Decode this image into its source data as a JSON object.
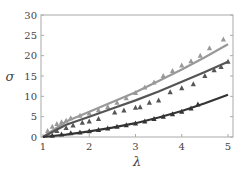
{
  "chart_data": {
    "type": "line",
    "title": "",
    "xlabel": "λ",
    "ylabel": "σ",
    "xlim": [
      1,
      5.1
    ],
    "ylim": [
      0,
      30
    ],
    "xticks": [
      1,
      2,
      3,
      4,
      5
    ],
    "yticks": [
      0,
      5,
      10,
      15,
      20,
      25,
      30
    ],
    "grid": false,
    "legend": null,
    "series": [
      {
        "name": "upper",
        "color": "#999999",
        "kind": "fit-line",
        "x": [
          1,
          1.5,
          2,
          2.5,
          3,
          3.5,
          4,
          4.5,
          5
        ],
        "y": [
          0,
          3.8,
          6.2,
          8.6,
          11.0,
          13.8,
          16.6,
          19.6,
          22.8
        ]
      },
      {
        "name": "upper-data",
        "color": "#999999",
        "kind": "triangles",
        "x": [
          1.1,
          1.2,
          1.3,
          1.4,
          1.5,
          1.6,
          1.8,
          2.0,
          2.2,
          2.4,
          2.6,
          2.8,
          3.0,
          3.2,
          3.4,
          3.6,
          3.8,
          4.0,
          4.2,
          4.4,
          4.6,
          4.9
        ],
        "y": [
          1.5,
          2.5,
          3.2,
          3.6,
          4.0,
          4.6,
          5.2,
          5.8,
          6.6,
          7.4,
          8.4,
          9.5,
          10.8,
          12.2,
          13.4,
          15.0,
          16.2,
          17.6,
          18.6,
          20.0,
          21.8,
          24.0
        ]
      },
      {
        "name": "middle",
        "color": "#555555",
        "kind": "fit-line",
        "x": [
          1,
          1.5,
          2,
          2.5,
          3,
          3.5,
          4,
          4.5,
          5
        ],
        "y": [
          0,
          3.0,
          5.0,
          7.0,
          9.0,
          11.2,
          13.6,
          16.0,
          18.5
        ]
      },
      {
        "name": "middle-data",
        "color": "#555555",
        "kind": "triangles",
        "x": [
          1.3,
          1.5,
          1.65,
          1.85,
          2.0,
          2.2,
          2.55,
          2.75,
          3.0,
          3.1,
          3.3,
          3.5,
          3.75,
          4.0,
          4.25,
          4.5,
          4.7,
          4.85,
          5.0
        ],
        "y": [
          1.5,
          2.2,
          2.8,
          3.5,
          3.8,
          4.4,
          6.0,
          6.5,
          7.2,
          7.3,
          8.4,
          9.0,
          11.0,
          12.0,
          13.0,
          15.0,
          16.4,
          17.2,
          18.5
        ]
      },
      {
        "name": "lower",
        "color": "#333333",
        "kind": "fit-line",
        "x": [
          1,
          1.5,
          2,
          2.5,
          3,
          3.5,
          4,
          4.5,
          5
        ],
        "y": [
          0,
          0.6,
          1.4,
          2.3,
          3.4,
          4.8,
          6.4,
          8.3,
          10.4
        ]
      },
      {
        "name": "lower-data",
        "color": "#333333",
        "kind": "triangles",
        "x": [
          1.2,
          1.4,
          1.6,
          1.8,
          2.0,
          2.2,
          2.4,
          2.6,
          2.8,
          3.0,
          3.2,
          3.4,
          3.6,
          3.8,
          4.0,
          4.2,
          4.35
        ],
        "y": [
          0.3,
          0.6,
          0.9,
          1.1,
          1.4,
          1.7,
          2.1,
          2.5,
          2.9,
          3.3,
          3.8,
          4.4,
          5.0,
          5.6,
          6.2,
          7.0,
          8.0
        ]
      }
    ]
  },
  "axes": {
    "xlabel": "λ",
    "ylabel": "σ"
  }
}
